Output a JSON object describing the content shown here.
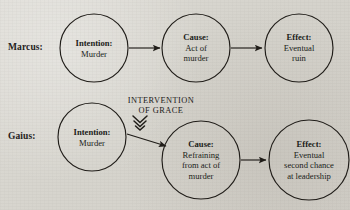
{
  "diagram": {
    "background_color": "#d9d7d1",
    "ink_color": "#201d19",
    "rows": [
      {
        "label": "Marcus:",
        "nodes": [
          {
            "head": "Intention:",
            "lines": [
              "Murder"
            ]
          },
          {
            "head": "Cause:",
            "lines": [
              "Act of",
              "murder"
            ]
          },
          {
            "head": "Effect:",
            "lines": [
              "Eventual",
              "ruin"
            ]
          }
        ]
      },
      {
        "label": "Gaius:",
        "nodes": [
          {
            "head": "Intention:",
            "lines": [
              "Murder"
            ]
          },
          {
            "head": "Cause:",
            "lines": [
              "Refraining",
              "from act of",
              "murder"
            ]
          },
          {
            "head": "Effect:",
            "lines": [
              "Eventual",
              "second chance",
              "at leadership"
            ]
          }
        ]
      }
    ],
    "annotation": {
      "line1": "INTERVENTION",
      "line2": "OF GRACE",
      "marker": "double-chevron-down-icon"
    }
  }
}
